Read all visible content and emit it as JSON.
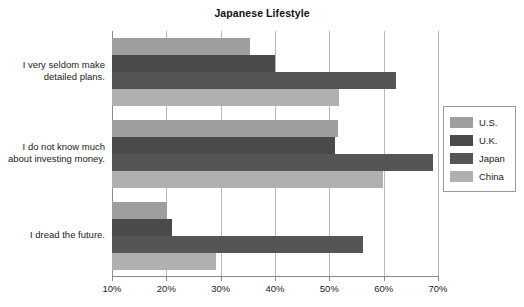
{
  "chart_data": {
    "type": "bar",
    "orientation": "horizontal",
    "title": "Japanese Lifestyle",
    "xlabel": "",
    "ylabel": "",
    "xlim": [
      10,
      70
    ],
    "xticks": [
      10,
      20,
      30,
      40,
      50,
      60,
      70
    ],
    "xtick_labels": [
      "10%",
      "20%",
      "30%",
      "40%",
      "50%",
      "60%",
      "70%"
    ],
    "grid": true,
    "legend_position": "right",
    "categories": [
      "I very seldom make detailed plans.",
      "I do not know much about investing money.",
      "I dread the future."
    ],
    "category_lines": [
      [
        "I very seldom make",
        "detailed plans."
      ],
      [
        "I do not know much",
        "about investing money."
      ],
      [
        "I dread the future."
      ]
    ],
    "series": [
      {
        "name": "U.S.",
        "color": "#9e9e9e",
        "values": [
          35.4,
          51.6,
          20.2
        ]
      },
      {
        "name": "U.K.",
        "color": "#4a4a4a",
        "values": [
          40.0,
          51.0,
          21.0
        ]
      },
      {
        "name": "Japan",
        "color": "#555555",
        "values": [
          62.2,
          69.0,
          56.2
        ]
      },
      {
        "name": "China",
        "color": "#b0b0b0",
        "values": [
          51.7,
          59.8,
          29.2
        ]
      }
    ]
  },
  "legend": {
    "items": [
      {
        "label": "U.S."
      },
      {
        "label": "U.K."
      },
      {
        "label": "Japan"
      },
      {
        "label": "China"
      }
    ]
  },
  "colors": {
    "background": "#ffffff",
    "axis": "#8a8a8a",
    "gridline": "#b9b9b9",
    "text": "#222222",
    "title": "#111111",
    "us": "#9e9e9e",
    "uk": "#4a4a4a",
    "japan": "#555555",
    "china": "#b0b0b0"
  }
}
